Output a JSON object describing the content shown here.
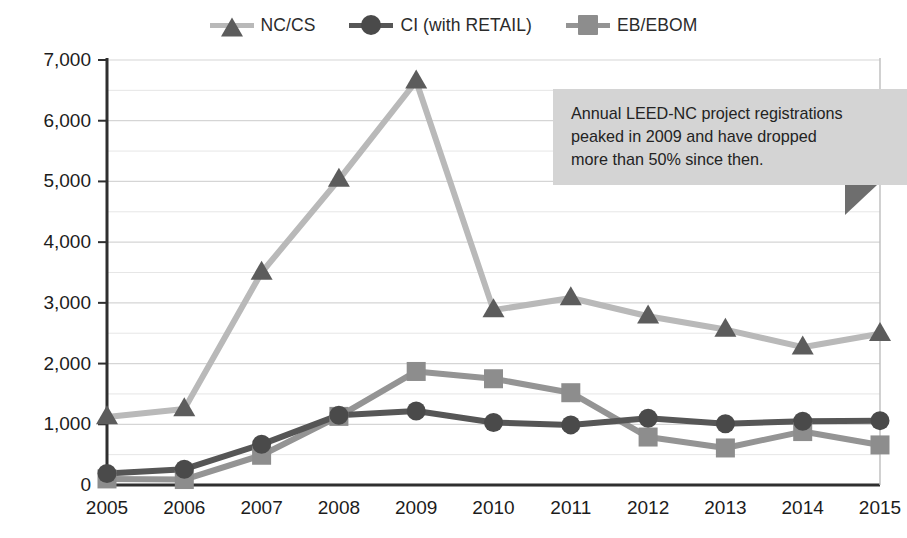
{
  "chart_data": {
    "type": "line",
    "title": "",
    "xlabel": "",
    "ylabel": "",
    "categories": [
      "2005",
      "2006",
      "2007",
      "2008",
      "2009",
      "2010",
      "2011",
      "2012",
      "2013",
      "2014",
      "2015"
    ],
    "x": [
      2005,
      2006,
      2007,
      2008,
      2009,
      2010,
      2011,
      2012,
      2013,
      2014,
      2015
    ],
    "ylim": [
      0,
      7000
    ],
    "xlim": [
      2005,
      2015
    ],
    "ytick_labels": [
      "0",
      "1,000",
      "2,000",
      "3,000",
      "4,000",
      "5,000",
      "6,000",
      "7,000"
    ],
    "ytick_values": [
      0,
      1000,
      2000,
      3000,
      4000,
      5000,
      6000,
      7000
    ],
    "ytick_step": 1000,
    "minor_gridline_step": 500,
    "grid": true,
    "grid_orientation": "horizontal",
    "legend_position": "top-center",
    "series": [
      {
        "name": "NC/CS",
        "marker": "triangle",
        "line_color": "#b9b9b9",
        "marker_color": "#5c5c5c",
        "values": [
          1120,
          1250,
          3500,
          5030,
          6650,
          2880,
          3080,
          2780,
          2560,
          2270,
          2490
        ]
      },
      {
        "name": "CI (with RETAIL)",
        "marker": "circle",
        "line_color": "#565656",
        "marker_color": "#4a4a4a",
        "values": [
          190,
          260,
          670,
          1150,
          1220,
          1030,
          990,
          1100,
          1010,
          1050,
          1060
        ]
      },
      {
        "name": "EB/EBOM",
        "marker": "square",
        "line_color": "#949494",
        "marker_color": "#8d8d8d",
        "values": [
          100,
          90,
          490,
          1130,
          1870,
          1750,
          1520,
          790,
          610,
          880,
          660
        ]
      }
    ],
    "annotations": [
      {
        "name": "callout",
        "text": "Annual LEED-NC project registrations peaked in 2009 and have dropped more than 50% since then."
      }
    ]
  },
  "legend": {
    "items": [
      {
        "label": "NC/CS"
      },
      {
        "label": "CI (with RETAIL)"
      },
      {
        "label": "EB/EBOM"
      }
    ]
  },
  "colors": {
    "nc_cs_line": "#b9b9b9",
    "nc_cs_marker": "#5c5c5c",
    "ci_line": "#565656",
    "ci_marker": "#4a4a4a",
    "eb_line": "#949494",
    "eb_marker": "#8d8d8d",
    "axis": "#2f2f2f",
    "grid": "#d9d9d9",
    "callout_bg": "#d4d4d4",
    "callout_tail": "#6e6e6e",
    "text": "#1c1c1c"
  },
  "callout": {
    "line1": "Annual LEED-NC project registrations",
    "line2": "peaked in 2009 and have dropped",
    "line3": "more than 50% since then.",
    "full_text": "Annual LEED-NC project registrations peaked in 2009 and have dropped more than 50% since then."
  }
}
